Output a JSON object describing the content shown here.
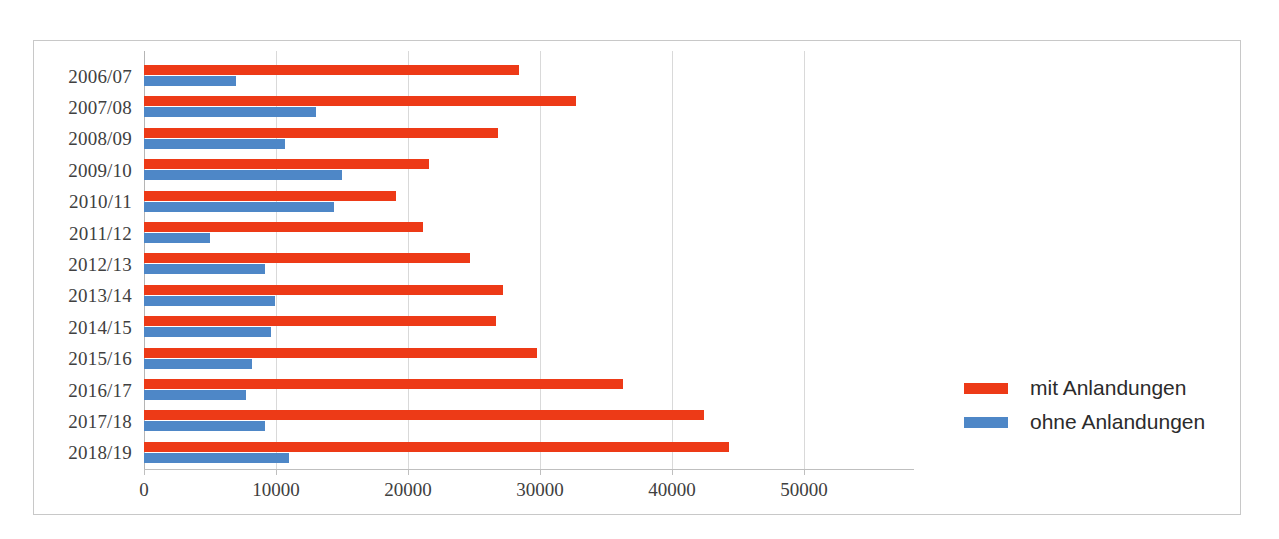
{
  "chart_data": {
    "type": "bar",
    "orientation": "horizontal",
    "title": "",
    "subtitle": "",
    "xlabel": "",
    "ylabel": "",
    "xlim": [
      0,
      50000
    ],
    "x_ticks": [
      0,
      10000,
      20000,
      30000,
      40000,
      50000
    ],
    "x_tick_labels": [
      "0",
      "10000",
      "20000",
      "30000",
      "40000",
      "50000"
    ],
    "grid": true,
    "grid_axis": "x",
    "legend_position": "right",
    "categories": [
      "2006/07",
      "2007/08",
      "2008/09",
      "2009/10",
      "2010/11",
      "2011/12",
      "2012/13",
      "2013/14",
      "2014/15",
      "2015/16",
      "2016/17",
      "2017/18",
      "2018/19"
    ],
    "series": [
      {
        "name": "mit Anlandungen",
        "color": "#ED3A17",
        "values": [
          28400,
          32700,
          26800,
          21600,
          19100,
          21100,
          24700,
          27200,
          26700,
          29800,
          36300,
          42400,
          44300
        ]
      },
      {
        "name": "ohne Anlandungen",
        "color": "#4E87C7",
        "values": [
          7000,
          13000,
          10700,
          15000,
          14400,
          5000,
          9200,
          9900,
          9600,
          8200,
          7700,
          9200,
          11000
        ]
      }
    ]
  },
  "legend": {
    "items": [
      {
        "label": "mit Anlandungen",
        "color": "#ED3A17"
      },
      {
        "label": "ohne Anlandungen",
        "color": "#4E87C7"
      }
    ]
  },
  "colors": {
    "series_red": "#ED3A17",
    "series_blue": "#4E87C7",
    "frame_border": "#c8c8c8",
    "gridline": "#d9d9d9",
    "axis": "#bfbfbf",
    "text": "#404040",
    "background": "#ffffff"
  }
}
